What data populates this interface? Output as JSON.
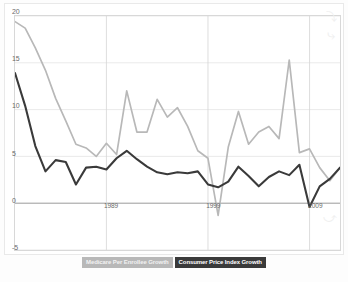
{
  "legend": {
    "position": "bottom",
    "items": [
      {
        "label": "Medicare Per Enrollee Growth",
        "color": "#b8b8b8"
      },
      {
        "label": "Consumer Price Index Growth",
        "color": "#3a3a3a"
      }
    ]
  },
  "axes": {
    "y_ticks": [
      "20",
      "15",
      "10",
      "5",
      "0",
      "-5"
    ],
    "x_ticks": [
      "1989",
      "1999",
      "2009"
    ]
  },
  "chart_data": {
    "type": "line",
    "title": "",
    "subtitle": "",
    "xlabel": "",
    "ylabel": "",
    "xlim": [
      1980,
      2012
    ],
    "ylim": [
      -5,
      20
    ],
    "ytick_values": [
      20,
      15,
      10,
      5,
      0,
      -5
    ],
    "xtick_values": [
      1989,
      1999,
      2009
    ],
    "grid": true,
    "legend_position": "bottom",
    "x": [
      1980,
      1981,
      1982,
      1983,
      1984,
      1985,
      1986,
      1987,
      1988,
      1989,
      1990,
      1991,
      1992,
      1993,
      1994,
      1995,
      1996,
      1997,
      1998,
      1999,
      2000,
      2001,
      2002,
      2003,
      2004,
      2005,
      2006,
      2007,
      2008,
      2009,
      2010,
      2011,
      2012
    ],
    "series": [
      {
        "name": "Medicare Per Enrollee Growth",
        "color": "#b8b8b8",
        "values": [
          19.4,
          18.7,
          16.6,
          14.2,
          11.2,
          8.8,
          6.3,
          5.9,
          5.0,
          6.4,
          5.2,
          12.0,
          7.6,
          7.6,
          11.1,
          9.2,
          10.2,
          8.2,
          5.6,
          4.8,
          -1.3,
          6.0,
          9.8,
          6.3,
          7.6,
          8.2,
          6.9,
          15.3,
          5.4,
          5.8,
          3.8,
          2.4,
          3.8
        ],
        "ylim": [
          -5,
          20
        ]
      },
      {
        "name": "Consumer Price Index Growth",
        "color": "#3a3a3a",
        "values": [
          13.9,
          10.4,
          6.1,
          3.4,
          4.6,
          4.4,
          2.0,
          3.8,
          3.9,
          3.6,
          4.8,
          5.6,
          4.7,
          3.9,
          3.3,
          3.1,
          3.3,
          3.2,
          3.4,
          2.0,
          1.7,
          2.3,
          3.9,
          2.9,
          1.8,
          2.8,
          3.4,
          3.0,
          4.1,
          -0.4,
          1.8,
          2.6,
          3.8
        ],
        "ylim": [
          -5,
          20
        ]
      }
    ]
  }
}
